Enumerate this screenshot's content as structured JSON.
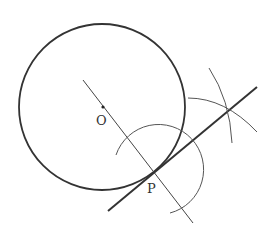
{
  "diagram": {
    "type": "geometric-construction",
    "points": {
      "O": {
        "label": "O",
        "x": 103,
        "y": 107
      },
      "P": {
        "label": "P",
        "x": 154,
        "y": 173
      }
    },
    "circle": {
      "cx": 102,
      "cy": 107,
      "r": 83
    },
    "colors": {
      "stroke": "#333333",
      "background": "#ffffff"
    }
  }
}
